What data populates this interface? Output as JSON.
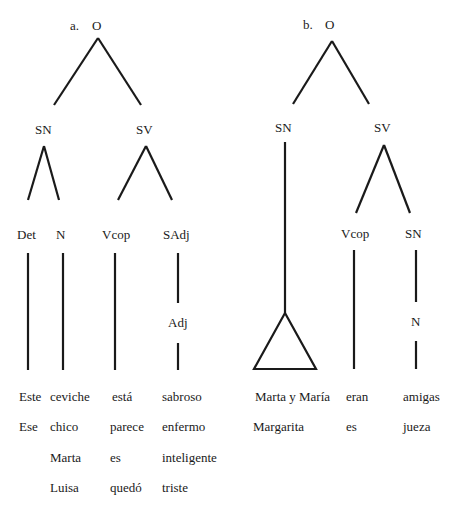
{
  "tree_a": {
    "marker": "a.",
    "root": "O",
    "nodes": {
      "sn": "SN",
      "sv": "SV",
      "det": "Det",
      "n": "N",
      "vcop": "Vcop",
      "sadj": "SAdj",
      "adj": "Adj"
    },
    "columns": {
      "det": [
        "Este",
        "Ese"
      ],
      "n": [
        "ceviche",
        "chico",
        "Marta",
        "Luisa"
      ],
      "vcop": [
        "está",
        "parece",
        "es",
        "quedó"
      ],
      "sadj": [
        "sabroso",
        "enfermo",
        "inteligente",
        "triste"
      ]
    }
  },
  "tree_b": {
    "marker": "b.",
    "root": "O",
    "nodes": {
      "sn": "SN",
      "sv": "SV",
      "vcop": "Vcop",
      "sn2": "SN",
      "n": "N"
    },
    "columns": {
      "sn": [
        "Marta y María",
        "Margarita"
      ],
      "vcop": [
        "eran",
        "es"
      ],
      "sn2": [
        "amigas",
        "jueza"
      ]
    }
  }
}
